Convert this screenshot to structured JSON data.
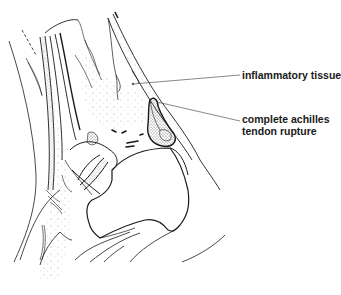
{
  "figure": {
    "labels": [
      {
        "id": "inflammatory-tissue",
        "lines": [
          "inflammatory tissue"
        ]
      },
      {
        "id": "complete-achilles-tendon-rupture",
        "lines": [
          "complete achilles",
          "tendon rupture"
        ]
      }
    ],
    "colors": {
      "ink": "#1a1a1a",
      "leader": "#555555",
      "stipple": "#9a9a9a",
      "background": "#ffffff"
    }
  }
}
